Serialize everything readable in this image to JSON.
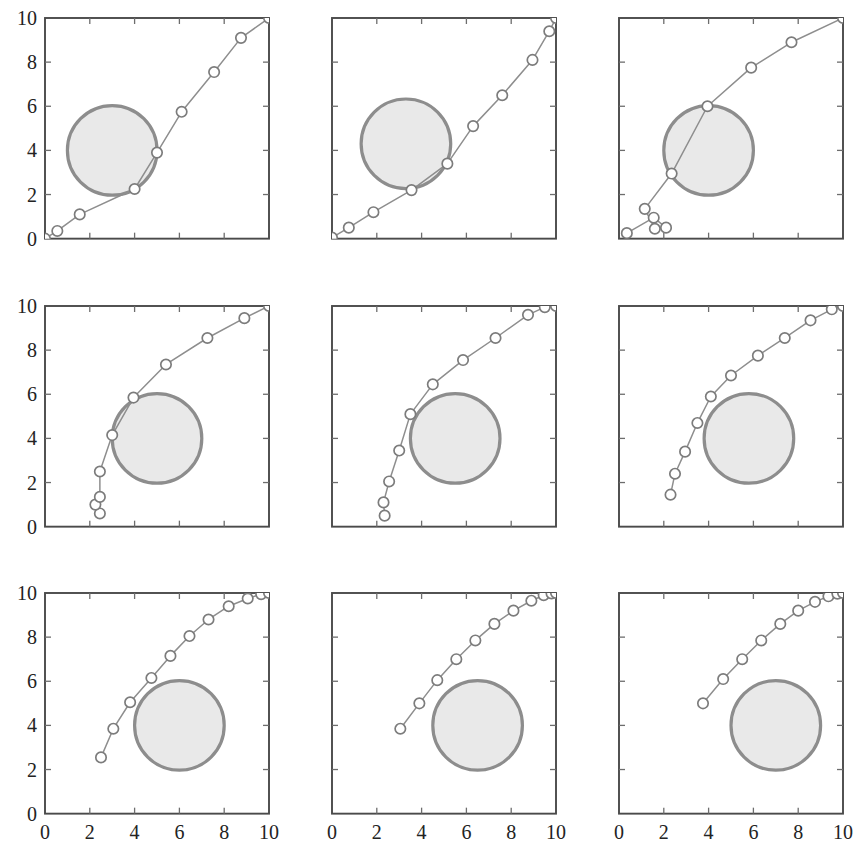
{
  "figure": {
    "title": "",
    "rows": 3,
    "cols": 3,
    "background_color": "#ffffff",
    "obstacle_fill_color": "#e9e9e9",
    "obstacle_stroke_color": "#8d8d8d",
    "path_color": "#8e8e8e",
    "marker_fill_color": "#ffffff",
    "marker_stroke_color": "#7c7c7c",
    "axis_color": "#4a4a4a"
  },
  "chart_data": [
    {
      "type": "line",
      "panel_index": 0,
      "panel_position": "row1-col1",
      "title": "",
      "xlabel": "",
      "ylabel": "",
      "xlim": [
        0,
        10
      ],
      "ylim": [
        0,
        10
      ],
      "xticks": [
        0,
        2,
        4,
        6,
        8,
        10
      ],
      "yticks": [
        0,
        2,
        4,
        6,
        8,
        10
      ],
      "xtick_labels": [],
      "ytick_labels": [
        "0",
        "2",
        "4",
        "6",
        "8",
        "10"
      ],
      "show_xtick_labels": false,
      "show_ytick_labels": true,
      "grid": false,
      "legend": null,
      "obstacle": {
        "shape": "circle",
        "cx": 3.0,
        "cy": 4.0,
        "r": 2.0
      },
      "series": [
        {
          "name": "path",
          "marker": "circle-open",
          "x": [
            0.0,
            0.55,
            1.55,
            4.0,
            5.0,
            6.1,
            7.55,
            8.75,
            10.0
          ],
          "y": [
            0.0,
            0.35,
            1.1,
            2.25,
            3.9,
            5.75,
            7.55,
            9.1,
            10.0
          ]
        }
      ]
    },
    {
      "type": "line",
      "panel_index": 1,
      "panel_position": "row1-col2",
      "title": "",
      "xlabel": "",
      "ylabel": "",
      "xlim": [
        0,
        10
      ],
      "ylim": [
        0,
        10
      ],
      "xticks": [
        0,
        2,
        4,
        6,
        8,
        10
      ],
      "yticks": [
        0,
        2,
        4,
        6,
        8,
        10
      ],
      "xtick_labels": [],
      "ytick_labels": [],
      "show_xtick_labels": false,
      "show_ytick_labels": false,
      "grid": false,
      "legend": null,
      "obstacle": {
        "shape": "circle",
        "cx": 3.3,
        "cy": 4.3,
        "r": 2.0
      },
      "series": [
        {
          "name": "path",
          "marker": "circle-open",
          "x": [
            0.0,
            0.75,
            1.85,
            3.55,
            5.15,
            6.3,
            7.6,
            8.95,
            9.7,
            10.0
          ],
          "y": [
            0.05,
            0.5,
            1.2,
            2.2,
            3.4,
            5.1,
            6.5,
            8.1,
            9.4,
            10.0
          ]
        }
      ]
    },
    {
      "type": "line",
      "panel_index": 2,
      "panel_position": "row1-col3",
      "title": "",
      "xlabel": "",
      "ylabel": "",
      "xlim": [
        0,
        10
      ],
      "ylim": [
        0,
        10
      ],
      "xticks": [
        0,
        2,
        4,
        6,
        8,
        10
      ],
      "yticks": [
        0,
        2,
        4,
        6,
        8,
        10
      ],
      "xtick_labels": [],
      "ytick_labels": [],
      "show_xtick_labels": false,
      "show_ytick_labels": false,
      "grid": false,
      "legend": null,
      "obstacle": {
        "shape": "circle",
        "cx": 4.0,
        "cy": 4.0,
        "r": 2.0
      },
      "series": [
        {
          "name": "path",
          "marker": "circle-open",
          "x": [
            0.35,
            1.55,
            2.1,
            1.6,
            1.15,
            2.35,
            3.95,
            5.9,
            7.7,
            10.0
          ],
          "y": [
            0.25,
            0.95,
            0.5,
            0.45,
            1.35,
            2.95,
            6.0,
            7.75,
            8.9,
            10.0
          ]
        }
      ]
    },
    {
      "type": "line",
      "panel_index": 3,
      "panel_position": "row2-col1",
      "title": "",
      "xlabel": "",
      "ylabel": "",
      "xlim": [
        0,
        10
      ],
      "ylim": [
        0,
        10
      ],
      "xticks": [
        0,
        2,
        4,
        6,
        8,
        10
      ],
      "yticks": [
        0,
        2,
        4,
        6,
        8,
        10
      ],
      "xtick_labels": [],
      "ytick_labels": [
        "0",
        "2",
        "4",
        "6",
        "8",
        "10"
      ],
      "show_xtick_labels": false,
      "show_ytick_labels": true,
      "grid": false,
      "legend": null,
      "obstacle": {
        "shape": "circle",
        "cx": 5.0,
        "cy": 4.0,
        "r": 2.0
      },
      "series": [
        {
          "name": "path",
          "marker": "circle-open",
          "x": [
            2.45,
            2.25,
            2.45,
            2.45,
            3.0,
            3.95,
            5.4,
            7.25,
            8.9,
            10.0
          ],
          "y": [
            0.6,
            1.0,
            1.35,
            2.5,
            4.15,
            5.85,
            7.35,
            8.55,
            9.45,
            10.0
          ]
        }
      ]
    },
    {
      "type": "line",
      "panel_index": 4,
      "panel_position": "row2-col2",
      "title": "",
      "xlabel": "",
      "ylabel": "",
      "xlim": [
        0,
        10
      ],
      "ylim": [
        0,
        10
      ],
      "xticks": [
        0,
        2,
        4,
        6,
        8,
        10
      ],
      "yticks": [
        0,
        2,
        4,
        6,
        8,
        10
      ],
      "xtick_labels": [],
      "ytick_labels": [],
      "show_xtick_labels": false,
      "show_ytick_labels": false,
      "grid": false,
      "legend": null,
      "obstacle": {
        "shape": "circle",
        "cx": 5.5,
        "cy": 4.0,
        "r": 2.0
      },
      "series": [
        {
          "name": "path",
          "marker": "circle-open",
          "x": [
            2.35,
            2.3,
            2.55,
            3.0,
            3.5,
            4.5,
            5.85,
            7.3,
            8.75,
            9.5,
            10.0
          ],
          "y": [
            0.5,
            1.1,
            2.05,
            3.45,
            5.1,
            6.45,
            7.55,
            8.55,
            9.6,
            9.95,
            10.0
          ]
        }
      ]
    },
    {
      "type": "line",
      "panel_index": 5,
      "panel_position": "row2-col3",
      "title": "",
      "xlabel": "",
      "ylabel": "",
      "xlim": [
        0,
        10
      ],
      "ylim": [
        0,
        10
      ],
      "xticks": [
        0,
        2,
        4,
        6,
        8,
        10
      ],
      "yticks": [
        0,
        2,
        4,
        6,
        8,
        10
      ],
      "xtick_labels": [],
      "ytick_labels": [],
      "show_xtick_labels": false,
      "show_ytick_labels": false,
      "grid": false,
      "legend": null,
      "obstacle": {
        "shape": "circle",
        "cx": 5.8,
        "cy": 4.0,
        "r": 2.0
      },
      "series": [
        {
          "name": "path",
          "marker": "circle-open",
          "x": [
            2.3,
            2.5,
            2.95,
            3.5,
            4.1,
            5.0,
            6.2,
            7.4,
            8.55,
            9.5,
            10.0
          ],
          "y": [
            1.45,
            2.4,
            3.4,
            4.7,
            5.9,
            6.85,
            7.75,
            8.55,
            9.35,
            9.85,
            10.0
          ]
        }
      ]
    },
    {
      "type": "line",
      "panel_index": 6,
      "panel_position": "row3-col1",
      "title": "",
      "xlabel": "",
      "ylabel": "",
      "xlim": [
        0,
        10
      ],
      "ylim": [
        0,
        10
      ],
      "xticks": [
        0,
        2,
        4,
        6,
        8,
        10
      ],
      "yticks": [
        0,
        2,
        4,
        6,
        8,
        10
      ],
      "xtick_labels": [
        "0",
        "2",
        "4",
        "6",
        "8",
        "10"
      ],
      "ytick_labels": [
        "0",
        "2",
        "4",
        "6",
        "8",
        "10"
      ],
      "show_xtick_labels": true,
      "show_ytick_labels": true,
      "grid": false,
      "legend": null,
      "obstacle": {
        "shape": "circle",
        "cx": 6.0,
        "cy": 4.0,
        "r": 2.0
      },
      "series": [
        {
          "name": "path",
          "marker": "circle-open",
          "x": [
            2.5,
            3.05,
            3.8,
            4.75,
            5.6,
            6.45,
            7.3,
            8.2,
            9.05,
            9.65,
            10.0
          ],
          "y": [
            2.55,
            3.85,
            5.05,
            6.15,
            7.15,
            8.05,
            8.8,
            9.4,
            9.75,
            9.95,
            10.0
          ]
        }
      ]
    },
    {
      "type": "line",
      "panel_index": 7,
      "panel_position": "row3-col2",
      "title": "",
      "xlabel": "",
      "ylabel": "",
      "xlim": [
        0,
        10
      ],
      "ylim": [
        0,
        10
      ],
      "xticks": [
        0,
        2,
        4,
        6,
        8,
        10
      ],
      "yticks": [
        0,
        2,
        4,
        6,
        8,
        10
      ],
      "xtick_labels": [
        "0",
        "2",
        "4",
        "6",
        "8",
        "10"
      ],
      "ytick_labels": [],
      "show_xtick_labels": true,
      "show_ytick_labels": false,
      "grid": false,
      "legend": null,
      "obstacle": {
        "shape": "circle",
        "cx": 6.5,
        "cy": 4.0,
        "r": 2.0
      },
      "series": [
        {
          "name": "path",
          "marker": "circle-open",
          "x": [
            3.05,
            3.9,
            4.7,
            5.55,
            6.4,
            7.25,
            8.1,
            8.9,
            9.45,
            9.8,
            10.0
          ],
          "y": [
            3.85,
            5.0,
            6.05,
            7.0,
            7.85,
            8.6,
            9.2,
            9.65,
            9.9,
            9.98,
            10.0
          ]
        }
      ]
    },
    {
      "type": "line",
      "panel_index": 8,
      "panel_position": "row3-col3",
      "title": "",
      "xlabel": "",
      "ylabel": "",
      "xlim": [
        0,
        10
      ],
      "ylim": [
        0,
        10
      ],
      "xticks": [
        0,
        2,
        4,
        6,
        8,
        10
      ],
      "yticks": [
        0,
        2,
        4,
        6,
        8,
        10
      ],
      "xtick_labels": [
        "0",
        "2",
        "4",
        "6",
        "8",
        "10"
      ],
      "ytick_labels": [],
      "show_xtick_labels": true,
      "show_ytick_labels": false,
      "grid": false,
      "legend": null,
      "obstacle": {
        "shape": "circle",
        "cx": 7.0,
        "cy": 4.0,
        "r": 2.0
      },
      "series": [
        {
          "name": "path",
          "marker": "circle-open",
          "x": [
            3.75,
            4.65,
            5.5,
            6.35,
            7.2,
            8.0,
            8.75,
            9.35,
            9.75,
            10.0
          ],
          "y": [
            5.0,
            6.1,
            7.0,
            7.85,
            8.6,
            9.2,
            9.6,
            9.85,
            9.97,
            10.0
          ]
        }
      ]
    }
  ]
}
